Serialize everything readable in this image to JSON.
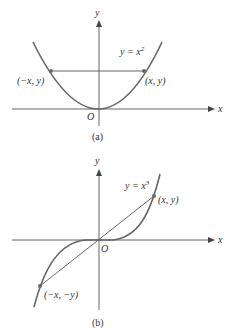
{
  "panel_a": {
    "y_axis_label": "y",
    "x_axis_label": "x",
    "origin_label": "O",
    "equation_base": "y = x",
    "equation_exp": "2",
    "point_left": "(−x, y)",
    "point_right": "(x, y)",
    "caption": "(a)"
  },
  "panel_b": {
    "y_axis_label": "y",
    "x_axis_label": "x",
    "origin_label": "O",
    "equation_base": "y = x",
    "equation_exp": "3",
    "point_upper": "(x, y)",
    "point_lower": "(−x, −y)",
    "caption": "(b)"
  }
}
